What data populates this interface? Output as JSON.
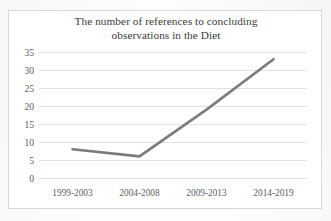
{
  "chart_data": {
    "type": "line",
    "title": "The number of references to concluding observations in the Diet",
    "title_line1": "The number of references to concluding",
    "title_line2": "observations in the Diet",
    "xlabel": "",
    "ylabel": "",
    "categories": [
      "1999-2003",
      "2004-2008",
      "2009-2013",
      "2014-2019"
    ],
    "values": [
      8,
      6,
      19,
      33
    ],
    "series": [
      {
        "name": "References to concluding observations",
        "values": [
          8,
          6,
          19,
          33
        ]
      }
    ],
    "ylim": [
      0,
      35
    ],
    "yticks": [
      0,
      5,
      10,
      15,
      20,
      25,
      30,
      35
    ],
    "ytick_labels": [
      "0",
      "5",
      "10",
      "15",
      "20",
      "25",
      "30",
      "35"
    ],
    "grid": true,
    "grid_axis": "y",
    "legend": false,
    "legend_position": "none",
    "markers": false,
    "line_color": "#7b7b7b",
    "line_width": 2.6,
    "grid_color": "#e2e2e2",
    "text_color": "#5d5d5d",
    "title_color": "#3b3b3b",
    "background_color": "#ffffff",
    "border_color": "#d8d8d8"
  }
}
